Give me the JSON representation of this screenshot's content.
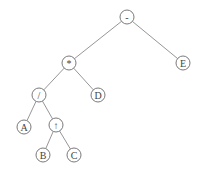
{
  "diagram": {
    "type": "expression-tree",
    "colors": {
      "edge": "#8a8a8a",
      "node_stroke": "#7a7a7a",
      "text": "#444444",
      "background": "#ffffff"
    },
    "node_radius": 7,
    "nodes": [
      {
        "id": "n0",
        "label": "-",
        "x": 127,
        "y": 17
      },
      {
        "id": "n1",
        "label": "*",
        "x": 69,
        "y": 63
      },
      {
        "id": "n2",
        "label": "E",
        "x": 183,
        "y": 63
      },
      {
        "id": "n3",
        "label": "/",
        "x": 39,
        "y": 95
      },
      {
        "id": "n4",
        "label": "D",
        "x": 98,
        "y": 95
      },
      {
        "id": "n5",
        "label": "A",
        "x": 24,
        "y": 127
      },
      {
        "id": "n6",
        "label": "↑",
        "x": 56,
        "y": 125
      },
      {
        "id": "n7",
        "label": "B",
        "x": 43,
        "y": 155
      },
      {
        "id": "n8",
        "label": "C",
        "x": 74,
        "y": 155
      }
    ],
    "edges": [
      [
        "n0",
        "n1"
      ],
      [
        "n0",
        "n2"
      ],
      [
        "n1",
        "n3"
      ],
      [
        "n1",
        "n4"
      ],
      [
        "n3",
        "n5"
      ],
      [
        "n3",
        "n6"
      ],
      [
        "n6",
        "n7"
      ],
      [
        "n6",
        "n8"
      ]
    ]
  }
}
